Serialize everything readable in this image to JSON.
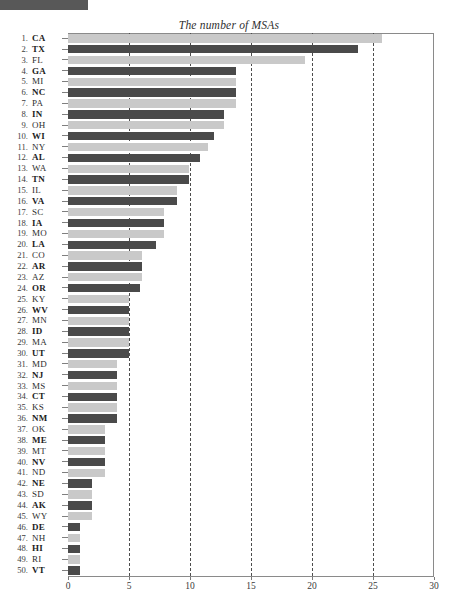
{
  "chart_data": {
    "type": "bar",
    "orientation": "horizontal",
    "title": "The number of MSAs",
    "xlabel": "",
    "ylabel": "",
    "xlim": [
      0,
      30
    ],
    "xticks": [
      0,
      5,
      10,
      15,
      20,
      25,
      30
    ],
    "xtick_labels": [
      "0",
      "5",
      "10",
      "15",
      "20",
      "25",
      "30"
    ],
    "grid": "vertical dashed at 5,10,15,20,25",
    "legend": "none",
    "colors": {
      "dark_bar": "#4a4a4a",
      "light_bar": "#c9c9c9",
      "axis": "#8a8a8a",
      "gridline": "#4d4d4d",
      "text": "#2e2e2e"
    },
    "categories": [
      "CA",
      "TX",
      "FL",
      "GA",
      "MI",
      "NC",
      "PA",
      "IN",
      "OH",
      "WI",
      "NY",
      "AL",
      "WA",
      "TN",
      "IL",
      "VA",
      "SC",
      "IA",
      "MO",
      "LA",
      "CO",
      "AR",
      "AZ",
      "OR",
      "KY",
      "WV",
      "MN",
      "ID",
      "MA",
      "UT",
      "MD",
      "NJ",
      "MS",
      "CT",
      "KS",
      "NM",
      "OK",
      "ME",
      "MT",
      "NV",
      "ND",
      "NE",
      "SD",
      "AK",
      "WY",
      "DE",
      "NH",
      "HI",
      "RI",
      "VT"
    ],
    "values": [
      25.7,
      23.8,
      19.4,
      13.8,
      13.8,
      13.8,
      13.8,
      12.8,
      12.8,
      12.0,
      11.5,
      10.8,
      9.9,
      9.9,
      8.9,
      8.9,
      7.9,
      7.9,
      7.9,
      7.2,
      6.1,
      6.1,
      6.1,
      5.9,
      5.0,
      5.0,
      5.0,
      5.0,
      5.0,
      5.0,
      4.0,
      4.0,
      4.0,
      4.0,
      4.0,
      4.0,
      3.0,
      3.0,
      3.0,
      3.0,
      3.0,
      2.0,
      2.0,
      2.0,
      2.0,
      1.0,
      1.0,
      1.0,
      1.0,
      1.0
    ]
  },
  "rows": [
    {
      "rank": "1.",
      "state": "CA",
      "value": 25.7,
      "shade": "light",
      "bold": true
    },
    {
      "rank": "2.",
      "state": "TX",
      "value": 23.8,
      "shade": "dark",
      "bold": true
    },
    {
      "rank": "3.",
      "state": "FL",
      "value": 19.4,
      "shade": "light",
      "bold": false
    },
    {
      "rank": "4.",
      "state": "GA",
      "value": 13.8,
      "shade": "dark",
      "bold": true
    },
    {
      "rank": "5.",
      "state": "MI",
      "value": 13.8,
      "shade": "light",
      "bold": false
    },
    {
      "rank": "6.",
      "state": "NC",
      "value": 13.8,
      "shade": "dark",
      "bold": true
    },
    {
      "rank": "7.",
      "state": "PA",
      "value": 13.8,
      "shade": "light",
      "bold": false
    },
    {
      "rank": "8.",
      "state": "IN",
      "value": 12.8,
      "shade": "dark",
      "bold": true
    },
    {
      "rank": "9.",
      "state": "OH",
      "value": 12.8,
      "shade": "light",
      "bold": false
    },
    {
      "rank": "10.",
      "state": "WI",
      "value": 12.0,
      "shade": "dark",
      "bold": true
    },
    {
      "rank": "11.",
      "state": "NY",
      "value": 11.5,
      "shade": "light",
      "bold": false
    },
    {
      "rank": "12.",
      "state": "AL",
      "value": 10.8,
      "shade": "dark",
      "bold": true
    },
    {
      "rank": "13.",
      "state": "WA",
      "value": 9.9,
      "shade": "light",
      "bold": false
    },
    {
      "rank": "14.",
      "state": "TN",
      "value": 9.9,
      "shade": "dark",
      "bold": true
    },
    {
      "rank": "15.",
      "state": "IL",
      "value": 8.9,
      "shade": "light",
      "bold": false
    },
    {
      "rank": "16.",
      "state": "VA",
      "value": 8.9,
      "shade": "dark",
      "bold": true
    },
    {
      "rank": "17.",
      "state": "SC",
      "value": 7.9,
      "shade": "light",
      "bold": false
    },
    {
      "rank": "18.",
      "state": "IA",
      "value": 7.9,
      "shade": "dark",
      "bold": true
    },
    {
      "rank": "19.",
      "state": "MO",
      "value": 7.9,
      "shade": "light",
      "bold": false
    },
    {
      "rank": "20.",
      "state": "LA",
      "value": 7.2,
      "shade": "dark",
      "bold": true
    },
    {
      "rank": "21.",
      "state": "CO",
      "value": 6.1,
      "shade": "light",
      "bold": false
    },
    {
      "rank": "22.",
      "state": "AR",
      "value": 6.1,
      "shade": "dark",
      "bold": true
    },
    {
      "rank": "23.",
      "state": "AZ",
      "value": 6.1,
      "shade": "light",
      "bold": false
    },
    {
      "rank": "24.",
      "state": "OR",
      "value": 5.9,
      "shade": "dark",
      "bold": true
    },
    {
      "rank": "25.",
      "state": "KY",
      "value": 5.0,
      "shade": "light",
      "bold": false
    },
    {
      "rank": "26.",
      "state": "WV",
      "value": 5.0,
      "shade": "dark",
      "bold": true
    },
    {
      "rank": "27.",
      "state": "MN",
      "value": 5.0,
      "shade": "light",
      "bold": false
    },
    {
      "rank": "28.",
      "state": "ID",
      "value": 5.0,
      "shade": "dark",
      "bold": true
    },
    {
      "rank": "29.",
      "state": "MA",
      "value": 5.0,
      "shade": "light",
      "bold": false
    },
    {
      "rank": "30.",
      "state": "UT",
      "value": 5.0,
      "shade": "dark",
      "bold": true
    },
    {
      "rank": "31.",
      "state": "MD",
      "value": 4.0,
      "shade": "light",
      "bold": false
    },
    {
      "rank": "32.",
      "state": "NJ",
      "value": 4.0,
      "shade": "dark",
      "bold": true
    },
    {
      "rank": "33.",
      "state": "MS",
      "value": 4.0,
      "shade": "light",
      "bold": false
    },
    {
      "rank": "34.",
      "state": "CT",
      "value": 4.0,
      "shade": "dark",
      "bold": true
    },
    {
      "rank": "35.",
      "state": "KS",
      "value": 4.0,
      "shade": "light",
      "bold": false
    },
    {
      "rank": "36.",
      "state": "NM",
      "value": 4.0,
      "shade": "dark",
      "bold": true
    },
    {
      "rank": "37.",
      "state": "OK",
      "value": 3.0,
      "shade": "light",
      "bold": false
    },
    {
      "rank": "38.",
      "state": "ME",
      "value": 3.0,
      "shade": "dark",
      "bold": true
    },
    {
      "rank": "39.",
      "state": "MT",
      "value": 3.0,
      "shade": "light",
      "bold": false
    },
    {
      "rank": "40.",
      "state": "NV",
      "value": 3.0,
      "shade": "dark",
      "bold": true
    },
    {
      "rank": "41.",
      "state": "ND",
      "value": 3.0,
      "shade": "light",
      "bold": false
    },
    {
      "rank": "42.",
      "state": "NE",
      "value": 2.0,
      "shade": "dark",
      "bold": true
    },
    {
      "rank": "43.",
      "state": "SD",
      "value": 2.0,
      "shade": "light",
      "bold": false
    },
    {
      "rank": "44.",
      "state": "AK",
      "value": 2.0,
      "shade": "dark",
      "bold": true
    },
    {
      "rank": "45.",
      "state": "WY",
      "value": 2.0,
      "shade": "light",
      "bold": false
    },
    {
      "rank": "46.",
      "state": "DE",
      "value": 1.0,
      "shade": "dark",
      "bold": true
    },
    {
      "rank": "47.",
      "state": "NH",
      "value": 1.0,
      "shade": "light",
      "bold": false
    },
    {
      "rank": "48.",
      "state": "HI",
      "value": 1.0,
      "shade": "dark",
      "bold": true
    },
    {
      "rank": "49.",
      "state": "RI",
      "value": 1.0,
      "shade": "light",
      "bold": false
    },
    {
      "rank": "50.",
      "state": "VT",
      "value": 1.0,
      "shade": "dark",
      "bold": true
    }
  ]
}
